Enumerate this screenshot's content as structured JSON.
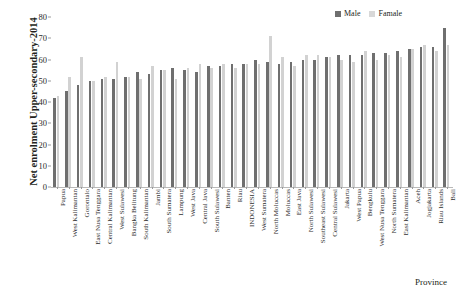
{
  "chart_data": {
    "type": "bar",
    "title": "",
    "ylabel": "Net enrolment Upper-secondary-2014",
    "xlabel": "Province",
    "ylim": [
      0,
      80
    ],
    "yticks": [
      0,
      10,
      20,
      30,
      40,
      50,
      60,
      70,
      80
    ],
    "grid": false,
    "legend_position": "top-right",
    "categories": [
      "Papua",
      "West Kalimantan",
      "Gorontalo",
      "East Nusa Tenggara",
      "Central Kalimantan",
      "West Sulawesi",
      "Bangka Belitung",
      "South Kalimantan",
      "Jambi",
      "South Sumatera",
      "Lampung",
      "West Java",
      "Central Java",
      "South Sulawesi",
      "Banten",
      "Riau",
      "INDONESIA",
      "West Sumatera",
      "North Moluccas",
      "Moluccas",
      "East Java",
      "North Sulawesi",
      "Southeast Sulawesi",
      "Central Sulawesi",
      "Jakarta",
      "West Papua",
      "Bengkulu",
      "West Nusa Tenggara",
      "North Sumatera",
      "East Kalimantan",
      "Aceh",
      "Jogjakarta",
      "Riau Islands",
      "Bali"
    ],
    "series": [
      {
        "name": "Male",
        "color": "#6f6f6f",
        "values": [
          42,
          45,
          48,
          50,
          51,
          51,
          52,
          54,
          53,
          55,
          56,
          55,
          54,
          57,
          57,
          58,
          58,
          60,
          59,
          58,
          59,
          60,
          60,
          61,
          62,
          62,
          62,
          63,
          63,
          64,
          65,
          66,
          66,
          75
        ]
      },
      {
        "name": "Famale",
        "color": "#d2d2d2",
        "values": [
          43,
          52,
          61,
          50,
          52,
          59,
          52,
          51,
          57,
          55,
          51,
          56,
          58,
          56,
          58,
          56,
          58,
          58,
          71,
          61,
          57,
          62,
          62,
          61,
          60,
          59,
          64,
          60,
          62,
          61,
          65,
          67,
          64,
          67
        ]
      }
    ]
  },
  "legend": {
    "items": [
      {
        "label": "Male",
        "color": "#6f6f6f"
      },
      {
        "label": "Famale",
        "color": "#d8d8d8"
      }
    ]
  },
  "axes": {
    "y_title": "Net enrolment Upper-secondary-2014",
    "x_title": "Province"
  }
}
